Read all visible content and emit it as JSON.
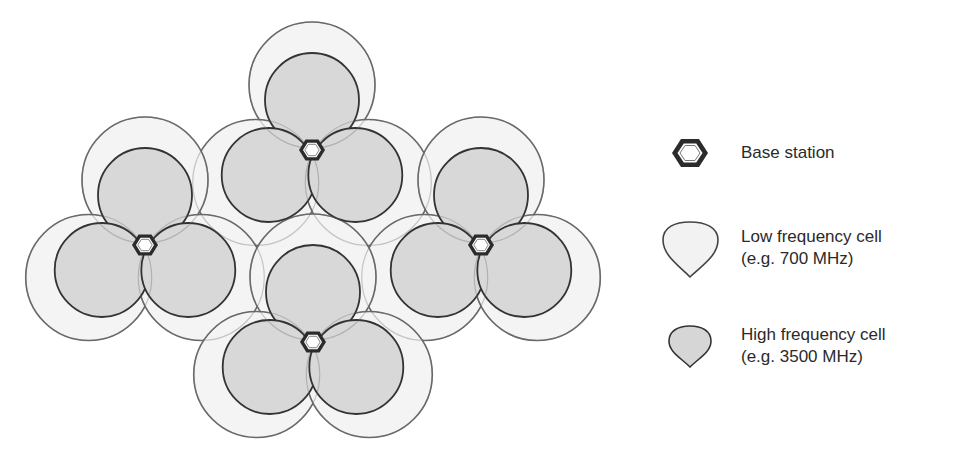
{
  "diagram": {
    "title": "",
    "base_stations": [
      {
        "id": "top",
        "x": 312,
        "y": 150
      },
      {
        "id": "left",
        "x": 145,
        "y": 245
      },
      {
        "id": "right",
        "x": 481,
        "y": 245
      },
      {
        "id": "bottom",
        "x": 313,
        "y": 342
      }
    ],
    "sector_angles_deg": [
      -90,
      150,
      30
    ],
    "low_frequency_cell": {
      "radius": 63,
      "offset": 65,
      "fill": "#f4f4f4",
      "stroke": "#6a6a6a"
    },
    "high_frequency_cell": {
      "radius": 47,
      "offset": 50,
      "fill": "#d8d8d8",
      "stroke": "#333333"
    }
  },
  "legend": {
    "items": [
      {
        "icon": "hexagon-base-station-icon",
        "line1": "Base station",
        "line2": ""
      },
      {
        "icon": "low-frequency-cell-icon",
        "line1": "Low frequency cell",
        "line2": "(e.g. 700 MHz)"
      },
      {
        "icon": "high-frequency-cell-icon",
        "line1": "High frequency cell",
        "line2": "(e.g. 3500 MHz)"
      }
    ]
  }
}
